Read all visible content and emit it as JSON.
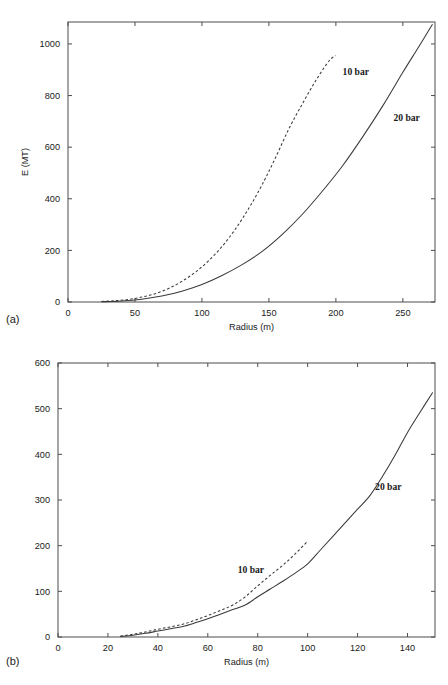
{
  "figure": {
    "panel_a_tag": "(a)",
    "panel_b_tag": "(b)",
    "line_color": "#3a3a3a",
    "axis_color": "#4d4d4d"
  },
  "chart_data": [
    {
      "type": "line",
      "panel": "(a)",
      "title": "",
      "xlabel": "Radius (m)",
      "ylabel": "E (MT)",
      "xlim": [
        0,
        274
      ],
      "ylim": [
        0,
        1085
      ],
      "xticks": [
        0,
        50,
        100,
        150,
        200,
        250
      ],
      "yticks": [
        0,
        200,
        400,
        600,
        800,
        1000
      ],
      "xtick_labels": [
        "0",
        "50",
        "100",
        "150",
        "200",
        "250"
      ],
      "ytick_labels": [
        "0",
        "200",
        "400",
        "600",
        "800",
        "1000"
      ],
      "grid": false,
      "legend": "inline-annotations",
      "series": [
        {
          "name": "10 bar",
          "style": "dashed",
          "label_x": 205,
          "label_y": 880,
          "x": [
            25,
            35,
            45,
            55,
            65,
            75,
            85,
            95,
            105,
            115,
            125,
            135,
            145,
            155,
            165,
            175,
            185,
            195,
            200
          ],
          "y": [
            2,
            5,
            10,
            19,
            32,
            52,
            80,
            115,
            160,
            215,
            283,
            363,
            455,
            560,
            672,
            768,
            858,
            935,
            955
          ]
        },
        {
          "name": "20 bar",
          "style": "solid",
          "label_x": 243,
          "label_y": 700,
          "x": [
            25,
            40,
            55,
            70,
            85,
            100,
            115,
            130,
            145,
            160,
            175,
            190,
            205,
            220,
            235,
            250,
            262,
            272
          ],
          "y": [
            1,
            4,
            11,
            23,
            42,
            68,
            103,
            145,
            196,
            262,
            340,
            430,
            528,
            640,
            760,
            890,
            990,
            1075
          ]
        }
      ]
    },
    {
      "type": "line",
      "panel": "(b)",
      "title": "",
      "xlabel": "Radius (m)",
      "ylabel": "",
      "xlim": [
        0,
        151
      ],
      "ylim": [
        0,
        600
      ],
      "xticks": [
        0,
        20,
        40,
        60,
        80,
        100,
        120,
        140
      ],
      "yticks": [
        0,
        100,
        200,
        300,
        400,
        500,
        600
      ],
      "xtick_labels": [
        "0",
        "20",
        "40",
        "60",
        "80",
        "100",
        "120",
        "140"
      ],
      "ytick_labels": [
        "0",
        "100",
        "200",
        "300",
        "400",
        "500",
        "600"
      ],
      "grid": false,
      "legend": "inline-annotations",
      "series": [
        {
          "name": "10 bar",
          "style": "dashed",
          "label_x": 72,
          "label_y": 140,
          "x": [
            25,
            30,
            35,
            40,
            45,
            50,
            55,
            60,
            65,
            70,
            75,
            80,
            85,
            90,
            95,
            100
          ],
          "y": [
            2,
            6,
            11,
            17,
            22,
            28,
            37,
            47,
            58,
            70,
            88,
            112,
            135,
            157,
            182,
            210
          ]
        },
        {
          "name": "20 bar",
          "style": "solid",
          "label_x": 127,
          "label_y": 322,
          "x": [
            25,
            30,
            35,
            40,
            45,
            50,
            55,
            60,
            65,
            70,
            75,
            80,
            85,
            90,
            95,
            100,
            105,
            110,
            115,
            120,
            125,
            130,
            135,
            140,
            145,
            150
          ],
          "y": [
            1,
            4,
            8,
            13,
            18,
            23,
            31,
            40,
            50,
            60,
            70,
            88,
            105,
            122,
            140,
            160,
            190,
            220,
            250,
            280,
            310,
            352,
            398,
            448,
            492,
            535
          ]
        }
      ]
    }
  ]
}
